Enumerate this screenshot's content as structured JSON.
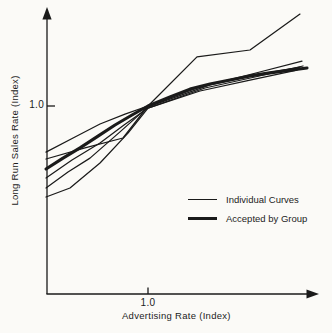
{
  "figure": {
    "background": "#fbfaf7",
    "ink": "#1a1a1a"
  },
  "chart_data": {
    "type": "line",
    "title": "",
    "xlabel": "Advertising Rate (Index)",
    "ylabel": "Long Run Sales Rate (Index)",
    "xlim": [
      0,
      2.67
    ],
    "ylim": [
      0,
      1.52
    ],
    "grid": false,
    "legend_position": "inside-lower-right",
    "xticks": [
      {
        "value": 1.0,
        "label": "1.0"
      }
    ],
    "yticks": [
      {
        "value": 1.0,
        "label": "1.0"
      }
    ],
    "legend": [
      {
        "label": "Individual Curves",
        "style": "thin"
      },
      {
        "label": "Accepted by Group",
        "style": "thick"
      }
    ],
    "series": [
      {
        "id": "individual-1",
        "legend": "Individual Curves",
        "style": "thin",
        "points": [
          [
            0,
            0.755
          ],
          [
            0.284,
            0.835
          ],
          [
            0.529,
            0.904
          ],
          [
            0.775,
            0.957
          ],
          [
            1.0,
            1.0
          ],
          [
            1.48,
            1.261
          ],
          [
            2.0,
            1.298
          ],
          [
            2.49,
            1.489
          ]
        ]
      },
      {
        "id": "individual-2",
        "legend": "Individual Curves",
        "style": "thin",
        "points": [
          [
            0,
            0.718
          ],
          [
            0.382,
            0.777
          ],
          [
            0.755,
            0.83
          ],
          [
            1.0,
            1.0
          ],
          [
            1.51,
            1.101
          ],
          [
            2.02,
            1.17
          ],
          [
            2.51,
            1.239
          ]
        ]
      },
      {
        "id": "individual-3",
        "legend": "Individual Curves",
        "style": "thin",
        "points": [
          [
            0,
            0.617
          ],
          [
            0.255,
            0.713
          ],
          [
            0.529,
            0.803
          ],
          [
            0.765,
            0.899
          ],
          [
            1.0,
            0.989
          ],
          [
            1.559,
            1.096
          ],
          [
            2.049,
            1.154
          ],
          [
            2.52,
            1.213
          ]
        ]
      },
      {
        "id": "individual-4",
        "legend": "Individual Curves",
        "style": "thin",
        "points": [
          [
            0,
            0.564
          ],
          [
            0.216,
            0.649
          ],
          [
            0.431,
            0.723
          ],
          [
            0.725,
            0.862
          ],
          [
            1.0,
            0.995
          ],
          [
            1.608,
            1.112
          ],
          [
            2.098,
            1.17
          ],
          [
            2.49,
            1.207
          ]
        ]
      },
      {
        "id": "individual-5",
        "legend": "Individual Curves",
        "style": "thin",
        "points": [
          [
            0,
            0.516
          ],
          [
            0.235,
            0.564
          ],
          [
            0.529,
            0.697
          ],
          [
            0.804,
            0.856
          ],
          [
            1.0,
            0.989
          ],
          [
            1.51,
            1.08
          ],
          [
            2.0,
            1.138
          ],
          [
            2.461,
            1.191
          ]
        ]
      },
      {
        "id": "accepted-by-group",
        "legend": "Accepted by Group",
        "style": "thick",
        "points": [
          [
            0,
            0.665
          ],
          [
            0.167,
            0.723
          ],
          [
            0.333,
            0.777
          ],
          [
            0.51,
            0.84
          ],
          [
            0.676,
            0.899
          ],
          [
            0.843,
            0.952
          ],
          [
            1.0,
            1.0
          ],
          [
            1.216,
            1.048
          ],
          [
            1.412,
            1.09
          ],
          [
            1.608,
            1.117
          ],
          [
            1.804,
            1.138
          ],
          [
            2.0,
            1.16
          ],
          [
            2.196,
            1.176
          ],
          [
            2.392,
            1.191
          ],
          [
            2.559,
            1.202
          ]
        ]
      }
    ]
  }
}
